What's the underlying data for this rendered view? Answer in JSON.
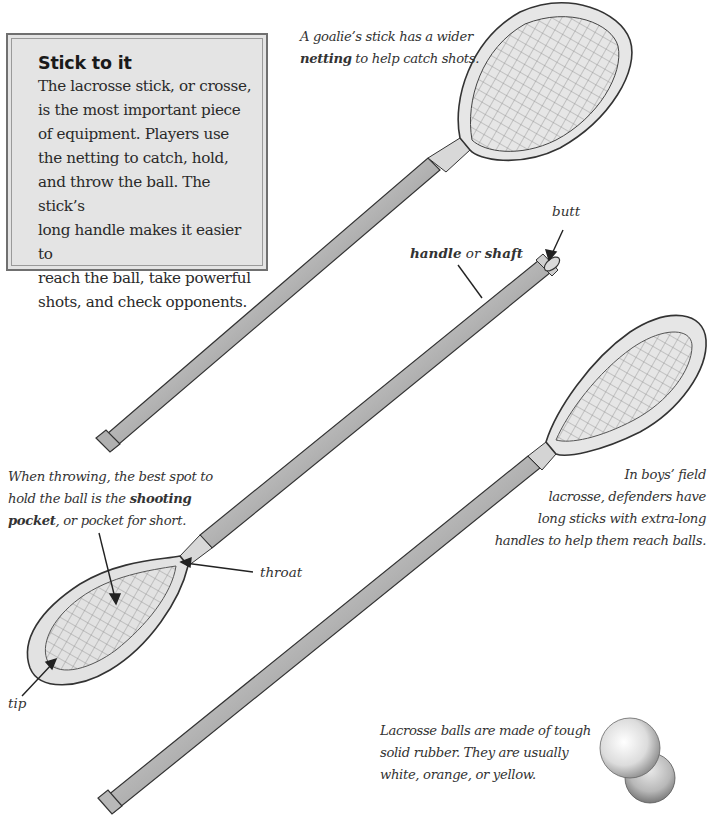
{
  "sidebar": {
    "title": "Stick to it",
    "body": "The lacrosse stick, or crosse,\nis the most important piece\nof equipment. Players use\nthe netting to catch, hold,\nand throw the ball. The stick’s\nlong handle makes it easier to\nreach the ball, take powerful\nshots, and check opponents."
  },
  "captions": {
    "goalie": {
      "line1": "A goalie’s stick has a wider",
      "line2_bold": "netting",
      "line2_rest": " to help catch shots."
    },
    "shooting_pocket": {
      "line1": "When throwing, the best spot to",
      "line2_pre": "hold the ball is the ",
      "line2_bold": "shooting",
      "line3_bold": "pocket",
      "line3_rest": ", or pocket for short."
    },
    "defenders": {
      "line1": "In boys’ field",
      "line2": "lacrosse, defenders have",
      "line3": "long sticks with extra-long",
      "line4": "handles to help them reach balls."
    },
    "balls": {
      "line1": "Lacrosse balls are made of tough",
      "line2": "solid rubber. They are usually",
      "line3": "white, orange, or yellow."
    }
  },
  "labels": {
    "butt": "butt",
    "handle_bold": "handle",
    "handle_or": " or ",
    "shaft_bold": "shaft",
    "throat": "throat",
    "tip": "tip"
  },
  "illustrations": {
    "sticks": [
      "goalie-stick",
      "attack-stick",
      "defender-long-stick"
    ],
    "balls": 2
  },
  "colors": {
    "sidebar_bg": "#e4e4e4",
    "sidebar_border": "#707070",
    "text": "#2a2a2a"
  }
}
